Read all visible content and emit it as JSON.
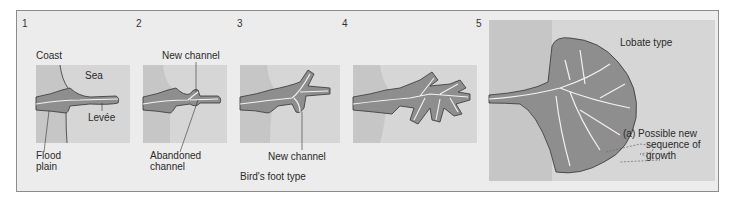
{
  "figure": {
    "panels": [
      {
        "number": "1",
        "labels": {
          "coast": "Coast",
          "sea": "Sea",
          "levee": "Levée",
          "flood_plain_1": "Flood",
          "flood_plain_2": "plain"
        }
      },
      {
        "number": "2",
        "labels": {
          "new_channel": "New channel",
          "abandoned_1": "Abandoned",
          "abandoned_2": "channel"
        }
      },
      {
        "number": "3",
        "labels": {
          "new_channel": "New channel"
        }
      },
      {
        "number": "4",
        "labels": {}
      },
      {
        "number": "5",
        "labels": {
          "type": "Lobate type",
          "possible_1": "(a)  Possible new",
          "possible_2": "sequence of",
          "possible_3": "growth"
        }
      }
    ],
    "group_caption": "Bird's foot type",
    "colors": {
      "frame_bg": "#ececec",
      "sea": "#d6d6d6",
      "land": "#c6c6c6",
      "delta": "#8e8e8e",
      "channel": "#f2f2f2",
      "outline": "#333333"
    }
  }
}
